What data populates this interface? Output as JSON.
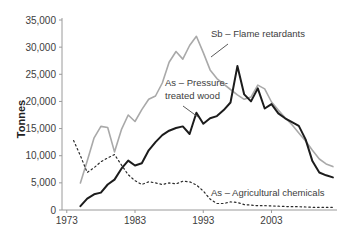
{
  "chart_data": {
    "type": "line",
    "title": "",
    "xlabel": "",
    "ylabel": "Tonnes",
    "grid": false,
    "legend": "inline-annotations",
    "xlim": [
      1972.3,
      2012.6
    ],
    "ylim": [
      0,
      35000
    ],
    "x_ticks": [
      1973,
      1983,
      1993,
      2003
    ],
    "x_tick_labels": [
      "1973",
      "1983",
      "1993",
      "2003"
    ],
    "y_ticks": [
      0,
      5000,
      10000,
      15000,
      20000,
      25000,
      30000,
      35000
    ],
    "y_tick_labels": [
      "0",
      "5,000",
      "10,000",
      "15,000",
      "20,000",
      "25,000",
      "30,000",
      "35,000"
    ],
    "axis_color": "#9a9a9a",
    "series": [
      {
        "id": "sb-flame-retardants",
        "name": "Sb – Flame retardants",
        "color": "#a9a9a9",
        "style": "solid",
        "width": 1.6,
        "points": [
          [
            1975,
            5000
          ],
          [
            1976,
            9000
          ],
          [
            1977,
            13300
          ],
          [
            1978,
            15400
          ],
          [
            1979,
            15200
          ],
          [
            1980,
            10700
          ],
          [
            1981,
            14800
          ],
          [
            1982,
            17500
          ],
          [
            1983,
            16300
          ],
          [
            1984,
            18500
          ],
          [
            1985,
            20400
          ],
          [
            1986,
            21000
          ],
          [
            1987,
            23400
          ],
          [
            1988,
            27200
          ],
          [
            1989,
            29200
          ],
          [
            1990,
            27800
          ],
          [
            1991,
            30300
          ],
          [
            1992,
            32000
          ],
          [
            1993,
            29000
          ],
          [
            1994,
            25800
          ],
          [
            1995,
            24200
          ],
          [
            1996,
            23200
          ],
          [
            1997,
            22200
          ],
          [
            1998,
            21200
          ],
          [
            1999,
            20400
          ],
          [
            2000,
            20800
          ],
          [
            2001,
            23000
          ],
          [
            2002,
            22300
          ],
          [
            2003,
            19900
          ],
          [
            2004,
            18400
          ],
          [
            2005,
            17000
          ],
          [
            2006,
            15700
          ],
          [
            2007,
            14200
          ],
          [
            2008,
            12700
          ],
          [
            2009,
            11000
          ],
          [
            2010,
            9400
          ],
          [
            2011,
            8500
          ],
          [
            2012,
            8000
          ]
        ]
      },
      {
        "id": "as-pressure-treated-wood",
        "name": "As – Pressure-treated wood",
        "color": "#1c1c1c",
        "style": "solid",
        "width": 2,
        "points": [
          [
            1975,
            700
          ],
          [
            1976,
            2100
          ],
          [
            1977,
            2900
          ],
          [
            1978,
            3200
          ],
          [
            1979,
            4700
          ],
          [
            1980,
            5600
          ],
          [
            1981,
            7600
          ],
          [
            1982,
            9100
          ],
          [
            1983,
            8200
          ],
          [
            1984,
            8600
          ],
          [
            1985,
            11000
          ],
          [
            1986,
            12500
          ],
          [
            1987,
            13800
          ],
          [
            1988,
            14600
          ],
          [
            1989,
            15100
          ],
          [
            1990,
            15400
          ],
          [
            1991,
            14000
          ],
          [
            1992,
            17900
          ],
          [
            1993,
            15900
          ],
          [
            1994,
            16900
          ],
          [
            1995,
            17300
          ],
          [
            1996,
            18400
          ],
          [
            1997,
            19800
          ],
          [
            1998,
            26500
          ],
          [
            1999,
            21300
          ],
          [
            2000,
            20000
          ],
          [
            2001,
            22400
          ],
          [
            2002,
            18700
          ],
          [
            2003,
            19500
          ],
          [
            2004,
            17800
          ],
          [
            2005,
            16900
          ],
          [
            2006,
            16200
          ],
          [
            2007,
            15500
          ],
          [
            2008,
            13000
          ],
          [
            2009,
            9000
          ],
          [
            2010,
            6900
          ],
          [
            2011,
            6400
          ],
          [
            2012,
            6000
          ]
        ]
      },
      {
        "id": "as-agricultural-chemicals",
        "name": "As – Agricultural chemicals",
        "color": "#2b2b2b",
        "style": "dotted",
        "width": 1.2,
        "points": [
          [
            1974,
            12800
          ],
          [
            1975,
            10000
          ],
          [
            1976,
            6900
          ],
          [
            1977,
            7800
          ],
          [
            1978,
            8900
          ],
          [
            1979,
            9600
          ],
          [
            1980,
            10200
          ],
          [
            1981,
            8300
          ],
          [
            1982,
            6500
          ],
          [
            1983,
            5400
          ],
          [
            1984,
            4700
          ],
          [
            1985,
            5200
          ],
          [
            1986,
            5000
          ],
          [
            1987,
            4700
          ],
          [
            1988,
            5000
          ],
          [
            1989,
            4800
          ],
          [
            1990,
            5300
          ],
          [
            1991,
            5200
          ],
          [
            1992,
            4600
          ],
          [
            1993,
            3500
          ],
          [
            1994,
            2000
          ],
          [
            1995,
            1200
          ],
          [
            1996,
            1200
          ],
          [
            1997,
            1500
          ],
          [
            1998,
            1400
          ],
          [
            1999,
            1000
          ],
          [
            2000,
            900
          ],
          [
            2001,
            800
          ],
          [
            2002,
            800
          ],
          [
            2003,
            750
          ],
          [
            2004,
            700
          ],
          [
            2005,
            650
          ],
          [
            2006,
            600
          ],
          [
            2007,
            600
          ],
          [
            2008,
            550
          ],
          [
            2009,
            500
          ],
          [
            2010,
            500
          ],
          [
            2011,
            500
          ],
          [
            2012,
            500
          ]
        ]
      }
    ],
    "annotations": [
      {
        "id": "sb-flame-retardants",
        "lines": [
          "Sb – Flame retardants"
        ],
        "x": 211,
        "y": 37,
        "line_height": 13,
        "leader": {
          "x1": 228,
          "y1": 44,
          "x2": 211,
          "y2": 57
        }
      },
      {
        "id": "as-pressure-treated-wood",
        "lines": [
          "As – Pressure-",
          "treated wood"
        ],
        "x": 165,
        "y": 86,
        "line_height": 13,
        "leader": {
          "x1": 183,
          "y1": 106,
          "x2": 198,
          "y2": 117
        }
      },
      {
        "id": "as-agricultural-chemicals",
        "lines": [
          "As – Agricultural chemicals"
        ],
        "x": 211,
        "y": 196,
        "line_height": 13,
        "leader": null
      }
    ],
    "layout": {
      "width": 346,
      "height": 239,
      "plot": {
        "left": 62,
        "right": 337,
        "top": 20,
        "bottom": 210
      },
      "y_axis_top": 18,
      "tick_len": 3,
      "y_label_offset": 6,
      "x_label_offset": 14,
      "y_title_x": 25,
      "y_title_y": 119
    }
  }
}
